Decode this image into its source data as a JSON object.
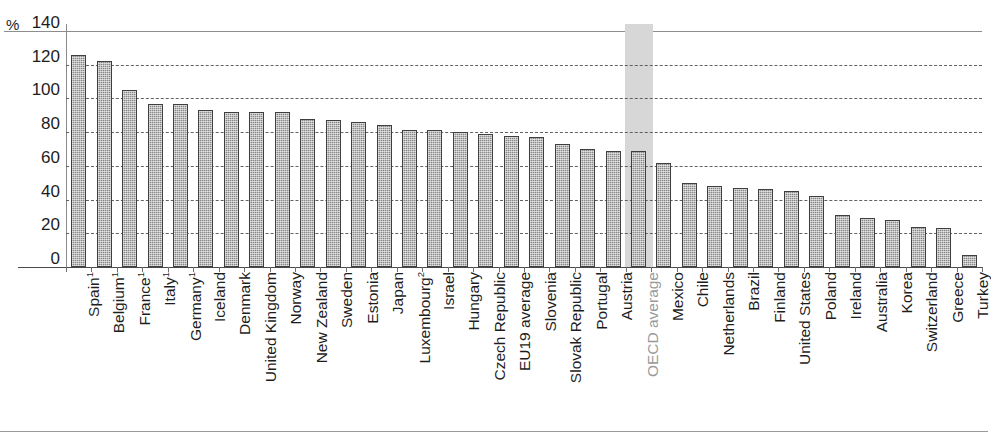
{
  "axis": {
    "unit": "%",
    "y_ticks": [
      "140",
      "120",
      "100",
      "80",
      "60",
      "40",
      "20",
      "0"
    ]
  },
  "highlight": {
    "category": "OECD average",
    "band_color": "#d7d7d7"
  },
  "colors": {
    "bar_fill": "#878787",
    "bar_stroke": "#3f3f3f",
    "grid": "#5a5a5a",
    "axis": "#4a4a4a",
    "muted_label": "#9a9a9a",
    "text": "#1d1d1d"
  },
  "chart_data": {
    "type": "bar",
    "title": "",
    "subtitle": "",
    "xlabel": "",
    "ylabel": "%",
    "ylim": [
      0,
      140
    ],
    "ytick_values": [
      0,
      20,
      40,
      60,
      80,
      100,
      120,
      140
    ],
    "grid": true,
    "legend": null,
    "categories": [
      "Spain¹",
      "Belgium¹",
      "France¹",
      "Italy¹",
      "Germany¹",
      "Iceland",
      "Denmark",
      "United Kingdom",
      "Norway",
      "New Zealand",
      "Sweden",
      "Estonia",
      "Japan",
      "Luxembourg²",
      "Israel",
      "Hungary",
      "Czech Republic",
      "EU19 average",
      "Slovenia",
      "Slovak Republic",
      "Portugal",
      "Austria",
      "OECD average",
      "Mexico",
      "Chile",
      "Netherlands",
      "Brazil",
      "Finland",
      "United States",
      "Poland",
      "Ireland",
      "Australia",
      "Korea",
      "Switzerland",
      "Greece",
      "Turkey"
    ],
    "categories_plain": [
      "Spain",
      "Belgium",
      "France",
      "Italy",
      "Germany",
      "Iceland",
      "Denmark",
      "United Kingdom",
      "Norway",
      "New Zealand",
      "Sweden",
      "Estonia",
      "Japan",
      "Luxembourg",
      "Israel",
      "Hungary",
      "Czech Republic",
      "EU19 average",
      "Slovenia",
      "Slovak Republic",
      "Portugal",
      "Austria",
      "OECD average",
      "Mexico",
      "Chile",
      "Netherlands",
      "Brazil",
      "Finland",
      "United States",
      "Poland",
      "Ireland",
      "Australia",
      "Korea",
      "Switzerland",
      "Greece",
      "Turkey"
    ],
    "footnotes": [
      {
        "marker": "1",
        "categories": [
          "Spain",
          "Belgium",
          "France",
          "Italy",
          "Germany"
        ]
      },
      {
        "marker": "2",
        "categories": [
          "Luxembourg"
        ]
      }
    ],
    "values": [
      126,
      122,
      105,
      97,
      97,
      93,
      92,
      92,
      92,
      88,
      87,
      86,
      84,
      81,
      81,
      80,
      79,
      78,
      77,
      73,
      70,
      69,
      69,
      62,
      50,
      48,
      47,
      46,
      45,
      42,
      31,
      29,
      28,
      24,
      23,
      7
    ]
  }
}
